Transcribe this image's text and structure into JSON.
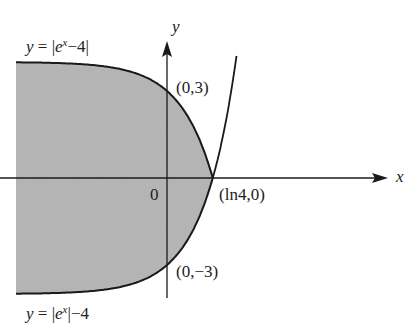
{
  "diagram": {
    "axes": {
      "x_label": "x",
      "y_label": "y",
      "origin_label": "0"
    },
    "curves": [
      {
        "name": "upper-curve",
        "equation": "y = |e^x − 4|",
        "label_prefix": "y = |e",
        "label_exp": "x",
        "label_suffix": "−4|"
      },
      {
        "name": "lower-curve",
        "equation": "y = |e^x| − 4",
        "label_prefix": "y = |e",
        "label_exp": "x",
        "label_suffix": "|−4"
      }
    ],
    "points": [
      {
        "label": "(0,3)",
        "x": 0,
        "y": 3
      },
      {
        "label": "(ln4,0)",
        "x": 1.386,
        "y": 0
      },
      {
        "label": "(0,−3)",
        "x": 0,
        "y": -3
      }
    ],
    "shaded_region": "Region bounded between y = |e^x − 4| and y = |e^x| − 4 for x ≤ ln4",
    "colors": {
      "shade": "#b4b4b4",
      "stroke": "#1a1a1a",
      "background": "#ffffff"
    }
  }
}
